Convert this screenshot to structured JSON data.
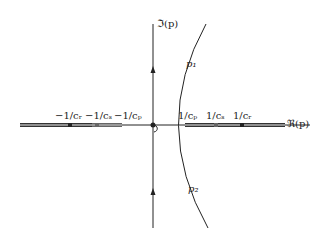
{
  "diagram": {
    "axes": {
      "imag_label": "ℑ(p)",
      "real_label": "ℜ(p)"
    },
    "points": {
      "p1": "p₁",
      "p2": "p₂"
    },
    "left_branch_labels": [
      "−1/cᵣ",
      "−1/cₛ",
      "−1/cₚ"
    ],
    "right_branch_labels": [
      "1/cₚ",
      "1/cₛ",
      "1/cᵣ"
    ]
  }
}
